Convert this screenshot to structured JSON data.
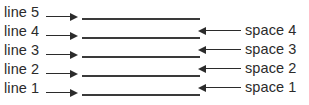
{
  "diagram": {
    "background_color": "#ffffff",
    "ink_color": "#2b2b2b",
    "rule_color": "#3a3a3a",
    "rows": [
      {
        "line_label": "line 5",
        "line_arrow": "arrow-right-icon",
        "has_blank_rule": true,
        "space_label": null,
        "space_arrow": null
      },
      {
        "line_label": "line 4",
        "line_arrow": "arrow-right-icon",
        "has_blank_rule": true,
        "space_label": "space 4",
        "space_arrow": "arrow-left-icon"
      },
      {
        "line_label": "line 3",
        "line_arrow": "arrow-right-icon",
        "has_blank_rule": true,
        "space_label": "space 3",
        "space_arrow": "arrow-left-icon"
      },
      {
        "line_label": "line 2",
        "line_arrow": "arrow-right-icon",
        "has_blank_rule": true,
        "space_label": "space 2",
        "space_arrow": "arrow-left-icon"
      },
      {
        "line_label": "line 1",
        "line_arrow": "arrow-right-icon",
        "has_blank_rule": true,
        "space_label": "space 1",
        "space_arrow": "arrow-left-icon"
      }
    ]
  }
}
